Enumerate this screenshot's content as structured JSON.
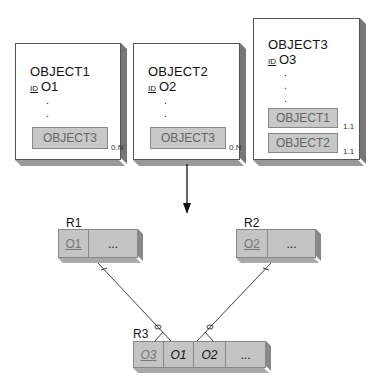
{
  "objects": [
    {
      "title": "OBJECT1",
      "id_tag": "ID",
      "id_value": "O1",
      "dots": [
        ".",
        ".",
        "."
      ],
      "refs": [
        {
          "label": "OBJECT3",
          "cardinality": "0.N"
        }
      ]
    },
    {
      "title": "OBJECT2",
      "id_tag": "ID",
      "id_value": "O2",
      "dots": [
        ".",
        ".",
        "."
      ],
      "refs": [
        {
          "label": "OBJECT3",
          "cardinality": "0.N"
        }
      ]
    },
    {
      "title": "OBJECT3",
      "id_tag": "ID",
      "id_value": "O3",
      "dots": [
        ".",
        ".",
        "."
      ],
      "refs": [
        {
          "label": "OBJECT1",
          "cardinality": "1.1"
        },
        {
          "label": "OBJECT2",
          "cardinality": "1.1"
        }
      ]
    }
  ],
  "tables": {
    "r1": {
      "label": "R1",
      "cells": [
        "O1",
        "..."
      ]
    },
    "r2": {
      "label": "R2",
      "cells": [
        "O2",
        "..."
      ]
    },
    "r3": {
      "label": "R3",
      "cells": [
        "O3",
        "O1",
        "O2",
        "..."
      ]
    }
  },
  "colors": {
    "ref_fill": "#c8c8c8",
    "table_fill": "#c4c4c4",
    "shadow": "#777777"
  }
}
